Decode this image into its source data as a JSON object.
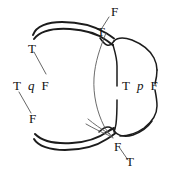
{
  "figure": {
    "width": 178,
    "height": 178,
    "background_color": "#ffffff",
    "stroke_color": "#1c1c1c",
    "leader_color": "#4a4a4a"
  },
  "labels": {
    "top_f": "F",
    "top_t": "T",
    "left_t": "T",
    "left_f": "F",
    "bottom_f": "F",
    "bottom_t": "T"
  },
  "groups": {
    "left": {
      "truth_left": "T",
      "variable": "q",
      "truth_right": "F"
    },
    "right": {
      "truth_left": "T",
      "variable": "p",
      "truth_right": "F"
    }
  },
  "annotations": {
    "leader_count": 4,
    "brace_count": 4
  }
}
